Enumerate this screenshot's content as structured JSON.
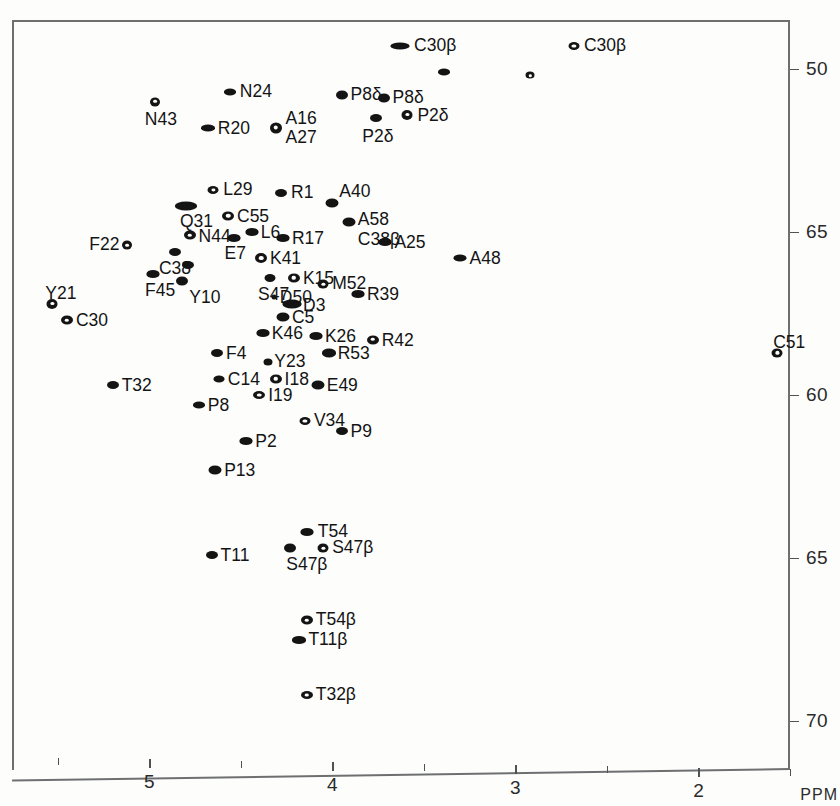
{
  "figure": {
    "type": "2d-nmr-spectrum",
    "x_axis": {
      "unit_label": "PPM",
      "major_ticks": [
        "5",
        "4",
        "3",
        "2"
      ],
      "major_tick_values": [
        5,
        4,
        3,
        2
      ],
      "minor_tick_values": [
        5.5,
        4.5,
        3.5,
        2.5,
        1.5
      ],
      "range": [
        5.75,
        1.5
      ],
      "direction": "decreasing"
    },
    "y_axis": {
      "tick_labels": [
        "50",
        "65",
        "60",
        "65",
        "70"
      ],
      "tick_values": [
        50,
        55,
        60,
        65,
        70
      ],
      "range": [
        48.5,
        71.5
      ],
      "direction": "increasing-downward"
    }
  },
  "chart_data": {
    "type": "scatter",
    "title": "",
    "xlabel": "PPM",
    "ylabel": "",
    "xlim": [
      5.75,
      1.5
    ],
    "ylim": [
      48.5,
      71.5
    ],
    "grid": false,
    "legend": "none",
    "points": [
      {
        "label": "C30β",
        "x": 3.63,
        "y": 49.3,
        "style": "filled",
        "w": 19,
        "h": 7,
        "lx": 14,
        "ly": -10
      },
      {
        "label": "C30β",
        "x": 2.68,
        "y": 49.3,
        "style": "openwide",
        "w": 11,
        "h": 8,
        "lx": 10,
        "ly": -10
      },
      {
        "label": "",
        "x": 3.39,
        "y": 50.1,
        "style": "filled",
        "w": 12,
        "h": 7,
        "lx": 0,
        "ly": 0
      },
      {
        "label": "",
        "x": 2.92,
        "y": 50.2,
        "style": "open",
        "w": 9,
        "h": 7,
        "lx": 0,
        "ly": 0
      },
      {
        "label": "N24",
        "x": 4.56,
        "y": 50.7,
        "style": "filled",
        "w": 12,
        "h": 7,
        "lx": 10,
        "ly": -10
      },
      {
        "label": "P8δ",
        "x": 3.95,
        "y": 50.8,
        "style": "filled",
        "w": 12,
        "h": 9,
        "lx": 9,
        "ly": -10
      },
      {
        "label": "P8δ",
        "x": 3.72,
        "y": 50.9,
        "style": "filled",
        "w": 12,
        "h": 9,
        "lx": 9,
        "ly": -10
      },
      {
        "label": "N43",
        "x": 4.97,
        "y": 51.0,
        "style": "open",
        "w": 10,
        "h": 9,
        "lx": -10,
        "ly": 8
      },
      {
        "label": "P2δ",
        "x": 3.76,
        "y": 51.5,
        "style": "filled",
        "w": 12,
        "h": 8,
        "lx": -14,
        "ly": 9
      },
      {
        "label": "P2δ",
        "x": 3.59,
        "y": 51.4,
        "style": "open",
        "w": 11,
        "h": 10,
        "lx": 10,
        "ly": -9
      },
      {
        "label": "R20",
        "x": 4.68,
        "y": 51.8,
        "style": "filled",
        "w": 14,
        "h": 7,
        "lx": 10,
        "ly": -9
      },
      {
        "label": "A16\nA27",
        "x": 4.31,
        "y": 51.8,
        "style": "open",
        "w": 12,
        "h": 11,
        "lx": 10,
        "ly": -19
      },
      {
        "label": "L29",
        "x": 4.65,
        "y": 53.7,
        "style": "open",
        "w": 11,
        "h": 8,
        "lx": 10,
        "ly": -10
      },
      {
        "label": "R1",
        "x": 4.28,
        "y": 53.8,
        "style": "filled",
        "w": 12,
        "h": 8,
        "lx": 10,
        "ly": -10
      },
      {
        "label": "A40",
        "x": 4.0,
        "y": 54.1,
        "style": "filled",
        "w": 13,
        "h": 9,
        "lx": 7,
        "ly": -21
      },
      {
        "label": "Q31",
        "x": 4.8,
        "y": 54.2,
        "style": "filled",
        "w": 22,
        "h": 9,
        "lx": -6,
        "ly": 6
      },
      {
        "label": "C55",
        "x": 4.57,
        "y": 54.5,
        "style": "open",
        "w": 12,
        "h": 9,
        "lx": 9,
        "ly": -9
      },
      {
        "label": "A58\nC38β",
        "x": 3.91,
        "y": 54.7,
        "style": "filled",
        "w": 13,
        "h": 9,
        "lx": 9,
        "ly": -12
      },
      {
        "label": "L6",
        "x": 4.44,
        "y": 55.0,
        "style": "filled",
        "w": 13,
        "h": 8,
        "lx": 9,
        "ly": -9
      },
      {
        "label": "N44",
        "x": 4.78,
        "y": 55.1,
        "style": "open",
        "w": 12,
        "h": 9,
        "lx": 9,
        "ly": -8
      },
      {
        "label": "R17",
        "x": 4.27,
        "y": 55.2,
        "style": "filled",
        "w": 13,
        "h": 8,
        "lx": 9,
        "ly": -9
      },
      {
        "label": "E7",
        "x": 4.54,
        "y": 55.2,
        "style": "filled",
        "w": 13,
        "h": 8,
        "lx": -9,
        "ly": 6
      },
      {
        "label": "A25",
        "x": 3.71,
        "y": 55.3,
        "style": "filled",
        "w": 13,
        "h": 8,
        "lx": 9,
        "ly": -9
      },
      {
        "label": "F22",
        "x": 5.12,
        "y": 55.4,
        "style": "open",
        "w": 10,
        "h": 9,
        "lx": -38,
        "ly": -10
      },
      {
        "label": "C38",
        "x": 4.86,
        "y": 55.6,
        "style": "filled",
        "w": 12,
        "h": 8,
        "lx": -16,
        "ly": 7
      },
      {
        "label": "K41",
        "x": 4.39,
        "y": 55.8,
        "style": "open",
        "w": 12,
        "h": 10,
        "lx": 9,
        "ly": -9
      },
      {
        "label": "A48",
        "x": 3.3,
        "y": 55.8,
        "style": "filled",
        "w": 13,
        "h": 7,
        "lx": 9,
        "ly": -9
      },
      {
        "label": "",
        "x": 4.79,
        "y": 56.0,
        "style": "filled",
        "w": 12,
        "h": 8,
        "lx": 0,
        "ly": 0
      },
      {
        "label": "F45",
        "x": 4.98,
        "y": 56.3,
        "style": "filled",
        "w": 13,
        "h": 8,
        "lx": -8,
        "ly": 7
      },
      {
        "label": "S47",
        "x": 4.34,
        "y": 56.4,
        "style": "filled",
        "w": 11,
        "h": 8,
        "lx": -12,
        "ly": 7
      },
      {
        "label": "K15",
        "x": 4.21,
        "y": 56.4,
        "style": "open",
        "w": 12,
        "h": 9,
        "lx": 9,
        "ly": -9
      },
      {
        "label": "Y10",
        "x": 4.82,
        "y": 56.5,
        "style": "filled",
        "w": 12,
        "h": 9,
        "lx": 7,
        "ly": 7
      },
      {
        "label": "M52",
        "x": 4.05,
        "y": 56.6,
        "style": "open",
        "w": 11,
        "h": 9,
        "lx": 9,
        "ly": -10
      },
      {
        "label": "R39",
        "x": 3.86,
        "y": 56.9,
        "style": "filled",
        "w": 13,
        "h": 8,
        "lx": 9,
        "ly": -9
      },
      {
        "label": "D50",
        "x": 4.32,
        "y": 57.0,
        "style": "filled",
        "w": 5,
        "h": 5,
        "lx": 6,
        "ly": -9
      },
      {
        "label": "D3",
        "x": 4.22,
        "y": 57.2,
        "style": "filled",
        "w": 19,
        "h": 9,
        "lx": 11,
        "ly": -8
      },
      {
        "label": "Y21",
        "x": 5.53,
        "y": 57.2,
        "style": "open",
        "w": 11,
        "h": 10,
        "lx": -7,
        "ly": -20
      },
      {
        "label": "C5",
        "x": 4.27,
        "y": 57.6,
        "style": "filled",
        "w": 13,
        "h": 9,
        "lx": 9,
        "ly": -9
      },
      {
        "label": "C30",
        "x": 5.45,
        "y": 57.7,
        "style": "open",
        "w": 12,
        "h": 9,
        "lx": 9,
        "ly": -9
      },
      {
        "label": "K46",
        "x": 4.38,
        "y": 58.1,
        "style": "filled",
        "w": 13,
        "h": 8,
        "lx": 9,
        "ly": -9
      },
      {
        "label": "K26",
        "x": 4.09,
        "y": 58.2,
        "style": "filled",
        "w": 13,
        "h": 8,
        "lx": 9,
        "ly": -9
      },
      {
        "label": "R42",
        "x": 3.78,
        "y": 58.3,
        "style": "open",
        "w": 12,
        "h": 9,
        "lx": 9,
        "ly": -9
      },
      {
        "label": "C51",
        "x": 1.57,
        "y": 58.7,
        "style": "open",
        "w": 11,
        "h": 9,
        "lx": -4,
        "ly": -20
      },
      {
        "label": "F4",
        "x": 4.63,
        "y": 58.7,
        "style": "filled",
        "w": 12,
        "h": 8,
        "lx": 9,
        "ly": -9
      },
      {
        "label": "R53",
        "x": 4.02,
        "y": 58.7,
        "style": "filled",
        "w": 14,
        "h": 9,
        "lx": 9,
        "ly": -9
      },
      {
        "label": "Y23",
        "x": 4.35,
        "y": 59.0,
        "style": "filled",
        "w": 9,
        "h": 7,
        "lx": 6,
        "ly": -10
      },
      {
        "label": "C14",
        "x": 4.62,
        "y": 59.5,
        "style": "filled",
        "w": 11,
        "h": 7,
        "lx": 9,
        "ly": -9
      },
      {
        "label": "I18",
        "x": 4.31,
        "y": 59.5,
        "style": "open",
        "w": 12,
        "h": 9,
        "lx": 9,
        "ly": -9
      },
      {
        "label": "T32",
        "x": 5.2,
        "y": 59.7,
        "style": "filled",
        "w": 12,
        "h": 8,
        "lx": 9,
        "ly": -9
      },
      {
        "label": "E49",
        "x": 4.08,
        "y": 59.7,
        "style": "filled",
        "w": 13,
        "h": 9,
        "lx": 9,
        "ly": -9
      },
      {
        "label": "I19",
        "x": 4.4,
        "y": 60.0,
        "style": "open",
        "w": 12,
        "h": 8,
        "lx": 9,
        "ly": -9
      },
      {
        "label": "P8",
        "x": 4.73,
        "y": 60.3,
        "style": "filled",
        "w": 12,
        "h": 7,
        "lx": 9,
        "ly": -9
      },
      {
        "label": "V34",
        "x": 4.15,
        "y": 60.8,
        "style": "open",
        "w": 11,
        "h": 8,
        "lx": 9,
        "ly": -10
      },
      {
        "label": "P9",
        "x": 3.95,
        "y": 61.1,
        "style": "filled",
        "w": 12,
        "h": 8,
        "lx": 9,
        "ly": -9
      },
      {
        "label": "P2",
        "x": 4.47,
        "y": 61.4,
        "style": "filled",
        "w": 13,
        "h": 8,
        "lx": 9,
        "ly": -9
      },
      {
        "label": "P13",
        "x": 4.64,
        "y": 62.3,
        "style": "filled",
        "w": 13,
        "h": 9,
        "lx": 9,
        "ly": -9
      },
      {
        "label": "T54",
        "x": 4.14,
        "y": 64.2,
        "style": "filled",
        "w": 13,
        "h": 8,
        "lx": 11,
        "ly": -10
      },
      {
        "label": "T11",
        "x": 4.66,
        "y": 64.9,
        "style": "filled",
        "w": 12,
        "h": 8,
        "lx": 9,
        "ly": -9
      },
      {
        "label": "S47β",
        "x": 4.23,
        "y": 64.7,
        "style": "filled",
        "w": 12,
        "h": 9,
        "lx": -4,
        "ly": 7
      },
      {
        "label": "S47β",
        "x": 4.05,
        "y": 64.7,
        "style": "open",
        "w": 11,
        "h": 9,
        "lx": 9,
        "ly": -10
      },
      {
        "label": "T54β",
        "x": 4.14,
        "y": 66.9,
        "style": "open",
        "w": 12,
        "h": 9,
        "lx": 9,
        "ly": -10
      },
      {
        "label": "T11β",
        "x": 4.18,
        "y": 67.5,
        "style": "filled",
        "w": 14,
        "h": 8,
        "lx": 9,
        "ly": -10
      },
      {
        "label": "T32β",
        "x": 4.14,
        "y": 69.2,
        "style": "open",
        "w": 12,
        "h": 8,
        "lx": 9,
        "ly": -10
      }
    ]
  }
}
